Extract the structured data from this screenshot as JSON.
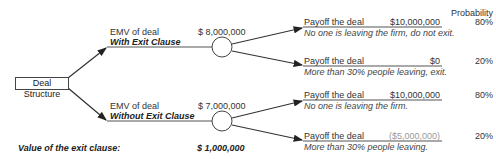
{
  "root": {
    "label": "Deal Structure"
  },
  "header": {
    "probability_label": "Probability"
  },
  "branches": [
    {
      "emv_label": "EMV of deal",
      "option_label": "With Exit Clause",
      "emv_value": "$ 8,000,000",
      "outcomes": [
        {
          "payoff_label": "Payoff the deal",
          "payoff_value": "$10,000,000",
          "description": "No one is leaving the firm, do not exit.",
          "probability": "80%"
        },
        {
          "payoff_label": "Payoff the deal",
          "payoff_value": "$0",
          "description": "More than 30% people leaving, exit.",
          "probability": "20%"
        }
      ]
    },
    {
      "emv_label": "EMV of deal",
      "option_label": "Without Exit Clause",
      "emv_value": "$ 7,000,000",
      "outcomes": [
        {
          "payoff_label": "Payoff the deal",
          "payoff_value": "$10,000,000",
          "description": "No one is leaving the firm.",
          "probability": "80%"
        },
        {
          "payoff_label": "Payoff the deal",
          "payoff_value": "($5,000,000)",
          "description": "More than 30% people leaving.",
          "probability": "20%"
        }
      ]
    }
  ],
  "summary": {
    "label": "Value of the exit clause:",
    "value": "$ 1,000,000"
  }
}
